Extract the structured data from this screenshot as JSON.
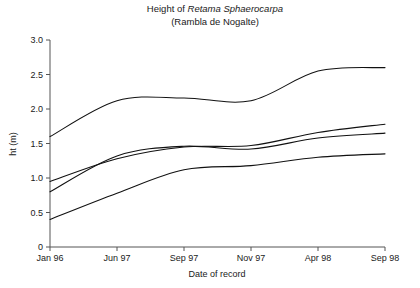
{
  "chart_data": {
    "type": "line",
    "title": "Height of Retama Sphaerocarpa",
    "title_plain_prefix": "Height of ",
    "title_italic_part": "Retama Sphaerocarpa",
    "subtitle": "(Rambla de Nogalte)",
    "xlabel": "Date of record",
    "ylabel": "ht (m)",
    "categories": [
      "Jan 96",
      "Jun 97",
      "Sep 97",
      "Nov 97",
      "Apr 98",
      "Sep 98"
    ],
    "x": [
      0,
      1,
      2,
      3,
      4,
      5
    ],
    "xlim": [
      0,
      5
    ],
    "ylim": [
      0,
      3.0
    ],
    "yticks": [
      0,
      0.5,
      1.0,
      1.5,
      2.0,
      2.5,
      3.0
    ],
    "ytick_labels": [
      "0",
      "0.5",
      "1.0",
      "1.5",
      "2.0",
      "2.5",
      "3.0"
    ],
    "grid": false,
    "legend": "none",
    "line_color": "#111111",
    "series": [
      {
        "name": "plant-1",
        "values": [
          1.6,
          2.12,
          2.16,
          2.12,
          2.55,
          2.6
        ]
      },
      {
        "name": "plant-2",
        "values": [
          0.95,
          1.28,
          1.45,
          1.47,
          1.66,
          1.78
        ]
      },
      {
        "name": "plant-3",
        "values": [
          0.8,
          1.32,
          1.46,
          1.42,
          1.58,
          1.65
        ]
      },
      {
        "name": "plant-4",
        "values": [
          0.4,
          0.78,
          1.12,
          1.18,
          1.3,
          1.35
        ]
      }
    ]
  },
  "figure": {
    "plot_left": 50,
    "plot_right": 385,
    "plot_top": 40,
    "plot_bottom": 247
  }
}
